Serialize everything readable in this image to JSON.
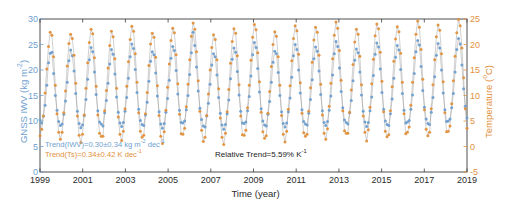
{
  "chart_data": {
    "type": "line",
    "title": "",
    "xlabel": "Time (year)",
    "ylabel": "GNSS IWV (kg m-2)",
    "y2label": "Temperature (C)",
    "xlim": [
      1999,
      2019
    ],
    "ylim": [
      0,
      30
    ],
    "y2lim": [
      -5,
      25
    ],
    "xticks": [
      1999,
      2001,
      2003,
      2005,
      2007,
      2009,
      2011,
      2013,
      2015,
      2017,
      2019
    ],
    "yticks": [
      0,
      5,
      10,
      15,
      20,
      25,
      30
    ],
    "y2ticks": [
      -5,
      0,
      5,
      10,
      15,
      20,
      25
    ],
    "grid": false,
    "legend": "none",
    "series": [
      {
        "name": "GNSS IWV",
        "color": "#6f9fd0",
        "axis": "left",
        "marker": "circle",
        "values": [
          10.2,
          9.6,
          11.0,
          13.1,
          17.0,
          21.4,
          23.3,
          23.5,
          19.3,
          15.0,
          12.1,
          9.9,
          9.1,
          9.4,
          11.3,
          13.9,
          17.6,
          21.8,
          23.9,
          22.8,
          19.8,
          15.4,
          11.9,
          9.5,
          8.7,
          9.2,
          11.1,
          14.2,
          18.2,
          22.0,
          24.4,
          23.6,
          19.6,
          15.2,
          12.0,
          9.8,
          9.4,
          9.0,
          11.6,
          14.0,
          17.4,
          21.2,
          24.0,
          23.1,
          19.2,
          14.7,
          11.7,
          9.6,
          8.9,
          9.7,
          11.9,
          14.6,
          18.4,
          22.6,
          25.1,
          24.2,
          20.1,
          15.6,
          12.3,
          10.1,
          9.3,
          9.1,
          11.2,
          13.7,
          17.8,
          21.7,
          23.6,
          23.0,
          19.4,
          14.9,
          11.8,
          9.4,
          8.6,
          9.5,
          11.7,
          14.4,
          18.0,
          22.3,
          24.6,
          23.8,
          19.9,
          15.3,
          12.1,
          9.7,
          9.6,
          10.0,
          12.2,
          15.0,
          19.1,
          23.4,
          27.4,
          24.8,
          20.6,
          15.9,
          12.5,
          10.3,
          9.0,
          8.8,
          11.0,
          13.5,
          17.2,
          21.0,
          23.2,
          22.6,
          19.0,
          14.6,
          11.5,
          9.2,
          8.4,
          9.3,
          11.4,
          14.1,
          18.3,
          22.1,
          24.3,
          23.5,
          19.7,
          15.1,
          11.9,
          9.6,
          9.5,
          9.8,
          12.0,
          14.8,
          18.8,
          23.0,
          25.4,
          24.4,
          20.3,
          15.7,
          12.4,
          10.0,
          9.2,
          9.0,
          11.3,
          13.8,
          17.6,
          21.5,
          23.7,
          23.2,
          19.5,
          15.0,
          11.8,
          9.5,
          8.8,
          9.6,
          11.8,
          14.5,
          18.6,
          22.8,
          25.0,
          24.0,
          20.0,
          15.5,
          12.2,
          9.9,
          9.4,
          9.2,
          11.5,
          14.2,
          18.1,
          22.2,
          24.5,
          23.7,
          19.8,
          15.2,
          12.0,
          9.7,
          9.1,
          9.9,
          12.1,
          14.9,
          19.0,
          23.2,
          25.6,
          24.6,
          20.4,
          15.8,
          12.6,
          10.2,
          9.7,
          9.4,
          11.6,
          14.0,
          17.9,
          21.9,
          24.1,
          23.4,
          19.6,
          15.1,
          11.9,
          9.8,
          8.9,
          9.7,
          12.0,
          14.7,
          18.9,
          23.1,
          25.3,
          24.5,
          20.2,
          15.6,
          12.3,
          10.0,
          9.3,
          9.1,
          11.4,
          14.3,
          18.4,
          22.5,
          24.8,
          23.9,
          20.1,
          15.4,
          12.1,
          9.6,
          9.8,
          10.1,
          12.3,
          15.1,
          19.3,
          23.6,
          25.8,
          24.9,
          20.7,
          16.0,
          12.7,
          10.4,
          9.5,
          9.3,
          11.7,
          14.6,
          18.7,
          22.9,
          25.2,
          24.3,
          20.0,
          15.5,
          12.2,
          9.9,
          10.0,
          10.4,
          12.6,
          15.4,
          19.6,
          24.0,
          26.2,
          25.1,
          21.0,
          16.3,
          12.9,
          10.6
        ]
      },
      {
        "name": "Temperature",
        "color": "#e2913c",
        "axis": "right",
        "marker": "circle",
        "values": [
          2.1,
          3.4,
          6.0,
          10.5,
          15.2,
          19.6,
          22.4,
          21.8,
          17.6,
          12.0,
          6.4,
          2.8,
          1.4,
          2.8,
          6.6,
          10.9,
          15.8,
          20.2,
          22.0,
          21.2,
          17.9,
          12.4,
          6.0,
          2.2,
          0.8,
          2.4,
          6.2,
          11.4,
          16.4,
          20.4,
          23.0,
          22.1,
          17.4,
          11.8,
          6.2,
          2.6,
          2.0,
          2.0,
          7.0,
          11.0,
          15.4,
          19.8,
          22.6,
          21.5,
          17.2,
          11.4,
          5.8,
          2.4,
          1.2,
          3.0,
          7.4,
          11.8,
          16.6,
          21.0,
          23.6,
          22.6,
          18.2,
          12.6,
          6.6,
          3.0,
          1.8,
          2.2,
          6.4,
          10.6,
          15.9,
          20.1,
          22.2,
          21.4,
          17.5,
          11.9,
          6.1,
          2.0,
          0.6,
          2.9,
          7.1,
          11.6,
          16.2,
          20.8,
          23.2,
          22.3,
          18.0,
          12.3,
          6.3,
          2.5,
          2.4,
          3.6,
          7.8,
          12.2,
          17.0,
          21.6,
          24.2,
          23.0,
          18.6,
          12.9,
          6.9,
          3.2,
          1.0,
          1.8,
          6.1,
          10.3,
          15.0,
          19.4,
          21.9,
          21.0,
          17.0,
          11.3,
          5.6,
          1.8,
          0.4,
          2.6,
          6.8,
          11.2,
          16.3,
          20.6,
          23.1,
          22.2,
          17.8,
          12.1,
          6.0,
          2.3,
          2.2,
          3.2,
          7.6,
          12.0,
          16.9,
          21.4,
          23.9,
          22.9,
          18.4,
          12.7,
          6.7,
          2.9,
          1.6,
          2.1,
          6.5,
          10.8,
          15.7,
          20.0,
          22.5,
          21.6,
          17.6,
          12.0,
          6.1,
          2.4,
          0.9,
          3.0,
          7.3,
          11.9,
          16.8,
          21.2,
          23.7,
          22.7,
          18.1,
          12.5,
          6.5,
          2.7,
          2.0,
          2.4,
          6.9,
          11.5,
          16.5,
          20.9,
          23.4,
          22.4,
          17.9,
          12.2,
          6.2,
          2.6,
          1.4,
          3.5,
          7.9,
          12.4,
          17.2,
          21.8,
          24.4,
          23.2,
          18.8,
          13.0,
          7.0,
          3.1,
          2.6,
          2.6,
          6.7,
          11.1,
          16.1,
          20.5,
          23.0,
          22.0,
          17.7,
          12.1,
          6.0,
          2.8,
          1.1,
          3.3,
          7.7,
          12.3,
          17.1,
          21.7,
          24.0,
          23.1,
          18.5,
          12.8,
          6.8,
          3.0,
          1.9,
          2.3,
          7.0,
          11.7,
          16.7,
          21.1,
          23.5,
          22.5,
          18.3,
          12.6,
          6.4,
          2.5,
          2.8,
          3.8,
          8.1,
          12.6,
          17.4,
          22.0,
          24.6,
          23.4,
          19.0,
          13.2,
          7.2,
          3.4,
          2.1,
          2.8,
          7.4,
          12.1,
          17.0,
          21.5,
          23.8,
          22.8,
          18.2,
          12.7,
          6.6,
          2.9,
          3.0,
          4.0,
          8.4,
          12.9,
          17.7,
          22.3,
          24.9,
          23.7,
          19.3,
          13.5,
          7.4,
          3.6
        ]
      }
    ],
    "annotations": {
      "trend_iwv": "Trend(IWV)=0.30±0.34 kg m",
      "trend_iwv_sup1": "-2",
      "trend_iwv_mid": " dec",
      "trend_iwv_sup2": "-1",
      "trend_ts": "Trend(Ts)=0.34±0.42 K dec",
      "trend_ts_sup": "-1",
      "relative_trend": "Relative Trend=5.59% K",
      "relative_trend_sup": "-1"
    }
  },
  "axes": {
    "ylabel_left_main": "GNSS IWV (kg m",
    "ylabel_left_sup": "-2",
    "ylabel_left_tail": ")",
    "ylabel_right_main": "Temperature (",
    "ylabel_right_sup": "o",
    "ylabel_right_tail": "C)",
    "xlabel": "Time (year)"
  },
  "colors": {
    "iwv": "#6f9fd0",
    "temperature": "#e2913c",
    "connector": "#9a9a9a",
    "axis": "#3c3c3c"
  }
}
